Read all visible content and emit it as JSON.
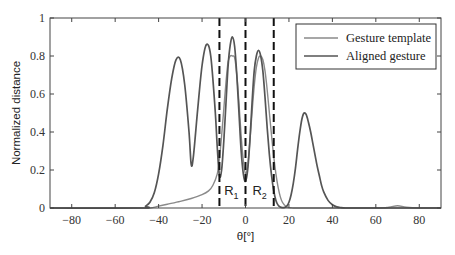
{
  "chart_data": {
    "type": "line",
    "title": "",
    "xlabel": "θ[°]",
    "ylabel": "Normalized distance",
    "xlim": [
      -90,
      90
    ],
    "ylim": [
      0,
      1
    ],
    "xticks": [
      -80,
      -60,
      -40,
      -20,
      0,
      20,
      40,
      60,
      80
    ],
    "xtick_labels": [
      "−80",
      "−60",
      "−40",
      "−20",
      "0",
      "20",
      "40",
      "60",
      "80"
    ],
    "yticks": [
      0,
      0.2,
      0.4,
      0.6,
      0.8,
      1
    ],
    "ytick_labels": [
      "0",
      "0.2",
      "0.4",
      "0.6",
      "0.8",
      "1"
    ],
    "grid": false,
    "legend_position": "upper right",
    "series": [
      {
        "name": "Gesture template",
        "color": "#8a8a8a",
        "x": [
          -90,
          -50,
          -44,
          -40,
          -36,
          -30,
          -25,
          -20,
          -17,
          -15,
          -13,
          -12,
          -11,
          -10,
          -9,
          -8,
          -7,
          -6,
          -5,
          -4,
          -3,
          -2,
          -1,
          0,
          1,
          2,
          3,
          4,
          5,
          6,
          7,
          8,
          9,
          10,
          11,
          12,
          13,
          14,
          15,
          16,
          17,
          18,
          19,
          20,
          21,
          22,
          24,
          30,
          60,
          66,
          70,
          74,
          80,
          90
        ],
        "y": [
          0,
          0,
          0,
          0.01,
          0.02,
          0.035,
          0.05,
          0.07,
          0.09,
          0.12,
          0.18,
          0.26,
          0.38,
          0.52,
          0.66,
          0.77,
          0.8,
          0.8,
          0.79,
          0.7,
          0.55,
          0.38,
          0.25,
          0.18,
          0.22,
          0.35,
          0.5,
          0.64,
          0.74,
          0.79,
          0.8,
          0.78,
          0.72,
          0.62,
          0.5,
          0.38,
          0.27,
          0.18,
          0.11,
          0.06,
          0.03,
          0.015,
          0.005,
          0.002,
          0.001,
          0,
          0,
          0,
          0,
          0.004,
          0.012,
          0.004,
          0,
          0
        ]
      },
      {
        "name": "Aligned gesture",
        "color": "#555555",
        "x": [
          -90,
          -48,
          -46,
          -44,
          -42,
          -40,
          -38,
          -36,
          -34,
          -32,
          -30,
          -28,
          -26,
          -25,
          -24,
          -22,
          -20,
          -18,
          -16,
          -14,
          -13,
          -12,
          -11,
          -10,
          -9,
          -8,
          -7,
          -6,
          -5,
          -4,
          -3,
          -2,
          -1,
          0,
          1,
          2,
          3,
          4,
          5,
          6,
          7,
          8,
          9,
          10,
          11,
          12,
          13,
          14,
          15,
          16,
          17,
          18,
          19,
          20,
          21,
          22,
          23,
          24,
          25,
          26,
          27,
          28,
          29,
          30,
          31,
          32,
          33,
          34,
          35,
          36,
          38,
          40,
          42,
          44,
          46,
          48,
          50,
          90
        ],
        "y": [
          0,
          0,
          0.01,
          0.03,
          0.08,
          0.18,
          0.33,
          0.52,
          0.68,
          0.78,
          0.78,
          0.65,
          0.4,
          0.23,
          0.27,
          0.52,
          0.75,
          0.86,
          0.8,
          0.52,
          0.32,
          0.17,
          0.2,
          0.35,
          0.55,
          0.75,
          0.86,
          0.9,
          0.85,
          0.7,
          0.5,
          0.3,
          0.18,
          0.14,
          0.2,
          0.35,
          0.55,
          0.72,
          0.8,
          0.83,
          0.8,
          0.72,
          0.58,
          0.42,
          0.28,
          0.17,
          0.09,
          0.04,
          0.015,
          0.005,
          0.002,
          0.003,
          0.01,
          0.03,
          0.07,
          0.13,
          0.21,
          0.31,
          0.4,
          0.47,
          0.5,
          0.49,
          0.45,
          0.4,
          0.34,
          0.28,
          0.22,
          0.17,
          0.12,
          0.085,
          0.04,
          0.017,
          0.006,
          0.002,
          0,
          0,
          0,
          0
        ]
      }
    ],
    "annotations": {
      "vertical_lines": [
        {
          "x": -12,
          "style": "dashed",
          "color": "#111111"
        },
        {
          "x": 0,
          "style": "dashed",
          "color": "#111111"
        },
        {
          "x": 13,
          "style": "dashed",
          "color": "#111111"
        }
      ],
      "region_labels": [
        {
          "text": "R",
          "subscript": "1",
          "x": -6.5,
          "y": 0.07
        },
        {
          "text": "R",
          "subscript": "2",
          "x": 6.5,
          "y": 0.07
        }
      ]
    }
  }
}
